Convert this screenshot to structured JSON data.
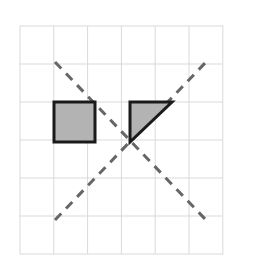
{
  "figure": {
    "title": "Grid diagram with shaded square, shaded right triangle and two dashed diagonal lines",
    "caption": "",
    "background_color": "#ffffff"
  },
  "grid": {
    "name": "square-grid",
    "columns": 6,
    "rows": 6,
    "x0": 20,
    "y0": 26,
    "cell_width": 33.8,
    "cell_height": 38.0,
    "line_color": "#d9d9d9",
    "line_width": 1,
    "border_color": "#d9d9d9",
    "fill_color": "#ffffff"
  },
  "shapes": [
    {
      "name": "shaded-square",
      "type": "square",
      "fill_color": "#b3b3b3",
      "stroke_color": "#1a1a1a",
      "stroke_width": 3,
      "grid_cell": {
        "column": 1,
        "row": 2
      },
      "points": "54,102 95,102 95,142 54,142"
    },
    {
      "name": "shaded-right-triangle",
      "type": "right-triangle",
      "fill_color": "#b3b3b3",
      "stroke_color": "#1a1a1a",
      "stroke_width": 3,
      "grid_cell": {
        "column": 3,
        "row": 2
      },
      "right_angle_at": "top-left",
      "points": "130,102 172,102 130,142"
    }
  ],
  "dashed_lines": [
    {
      "name": "dashed-diagonal-falling",
      "color": "#666666",
      "width": 3,
      "dash": "9 7",
      "x1": 55,
      "y1": 62,
      "x2": 206,
      "y2": 220
    },
    {
      "name": "dashed-diagonal-rising",
      "color": "#666666",
      "width": 3,
      "dash": "9 7",
      "x1": 55,
      "y1": 220,
      "x2": 206,
      "y2": 62
    }
  ],
  "intersection_point": {
    "name": "diagonals-intersection",
    "x": 130,
    "y": 141
  },
  "colors": {
    "shape_fill": "#b3b3b3",
    "shape_outline": "#1a1a1a",
    "grid_line": "#d9d9d9",
    "dash_line": "#666666",
    "background": "#ffffff"
  }
}
